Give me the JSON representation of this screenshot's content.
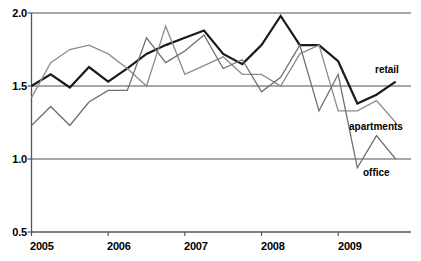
{
  "chart_data": {
    "type": "line",
    "title": "",
    "subtitle": "",
    "xlabel": "",
    "ylabel": "",
    "xlim": [
      2005.0,
      2009.95
    ],
    "ylim": [
      0.5,
      2.0
    ],
    "grid": true,
    "gridlines_y": [
      1.0,
      1.5,
      2.0
    ],
    "legend_position": "inline-right",
    "x_tick_labels": [
      "2005",
      "2006",
      "2007",
      "2008",
      "2009"
    ],
    "x_tick_values": [
      2005,
      2006,
      2007,
      2008,
      2009
    ],
    "y_tick_labels": [
      "0.5",
      "1.0",
      "1.5",
      "2.0"
    ],
    "y_tick_values": [
      0.5,
      1.0,
      1.5,
      2.0
    ],
    "x": [
      2005.0,
      2005.25,
      2005.5,
      2005.75,
      2006.0,
      2006.25,
      2006.5,
      2006.75,
      2007.0,
      2007.25,
      2007.5,
      2007.75,
      2008.0,
      2008.25,
      2008.5,
      2008.75,
      2009.0,
      2009.25,
      2009.5,
      2009.75
    ],
    "series": [
      {
        "name": "retail",
        "color": "#1a1a1a",
        "width": 2.2,
        "values": [
          1.5,
          1.58,
          1.49,
          1.63,
          1.53,
          1.62,
          1.72,
          1.78,
          1.83,
          1.88,
          1.72,
          1.65,
          1.78,
          1.98,
          1.78,
          1.78,
          1.67,
          1.38,
          1.44,
          1.53
        ]
      },
      {
        "name": "apartments",
        "color": "#8c8c8c",
        "width": 1.3,
        "values": [
          1.42,
          1.66,
          1.75,
          1.78,
          1.72,
          1.62,
          1.5,
          1.91,
          1.58,
          1.64,
          1.7,
          1.58,
          1.58,
          1.5,
          1.72,
          1.78,
          1.33,
          1.33,
          1.4,
          1.25
        ]
      },
      {
        "name": "office",
        "color": "#6e6e6e",
        "width": 1.3,
        "values": [
          1.23,
          1.36,
          1.23,
          1.39,
          1.47,
          1.47,
          1.83,
          1.66,
          1.74,
          1.85,
          1.62,
          1.68,
          1.46,
          1.56,
          1.78,
          1.33,
          1.58,
          0.94,
          1.16,
          1.0
        ]
      }
    ],
    "annotations": [
      {
        "text": "retail",
        "x_px": 375,
        "y_px": 71
      },
      {
        "text": "apartments",
        "x_px": 349,
        "y_px": 128
      },
      {
        "text": "office",
        "x_px": 363,
        "y_px": 174
      }
    ]
  },
  "axes": {
    "axis_color": "#555555",
    "gridline_color": "#8a8a8a",
    "background": "#ffffff"
  }
}
